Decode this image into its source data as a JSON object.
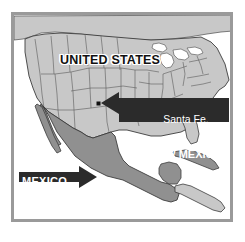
{
  "figure": {
    "kind": "locator-map",
    "width": 245,
    "height": 242
  },
  "frame": {
    "border_color": "#9a9a9a",
    "background_color": "#ffffff"
  },
  "colors": {
    "ocean": "#ffffff",
    "united_states_fill": "#c8c8c8",
    "canada_fill": "#c8c8c8",
    "mexico_fill": "#909090",
    "central_america_fill": "#909090",
    "cuba_fill": "#909090",
    "lakes": "#ffffff",
    "boundary_line": "#4a4a4a",
    "coastline": "#3c3c3c",
    "callout_box": "#2b2b2b",
    "callout_text": "#ffffff",
    "country_label_text": "#111111",
    "country_label_halo": "#ffffff",
    "city_marker": "#111111"
  },
  "labels": {
    "united_states": "UNITED STATES",
    "mexico": "MEXICO",
    "santa_fe_line1": "Santa Fe,",
    "santa_fe_line2": "NEW MEXICO"
  },
  "markers": [
    {
      "name": "santa-fe",
      "label": "Santa Fe",
      "x": 99,
      "y": 103,
      "shape": "square-dot",
      "color": "#111111"
    }
  ],
  "callouts": [
    {
      "name": "santa-fe-callout",
      "text_line1": "Santa Fe,",
      "text_line2": "NEW MEXICO",
      "arrow_direction": "left",
      "points_to": "santa-fe"
    },
    {
      "name": "mexico-callout",
      "text": "MEXICO",
      "arrow_direction": "right",
      "points_to": "mexico-landmass"
    }
  ],
  "regions": [
    {
      "name": "united-states",
      "label": "UNITED STATES",
      "fill": "#c8c8c8"
    },
    {
      "name": "canada",
      "label": "",
      "fill": "#c8c8c8"
    },
    {
      "name": "mexico",
      "label": "MEXICO",
      "fill": "#909090"
    },
    {
      "name": "central-america",
      "label": "",
      "fill": "#909090"
    },
    {
      "name": "cuba",
      "label": "",
      "fill": "#909090"
    },
    {
      "name": "great-lakes",
      "label": "",
      "fill": "#ffffff"
    }
  ]
}
